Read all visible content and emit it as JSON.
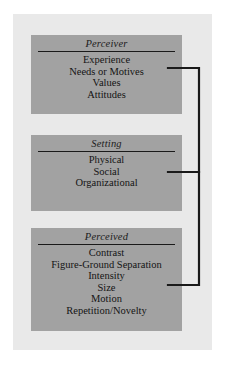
{
  "diagram": {
    "background_color": "#ffffff",
    "panel_color": "#e9e9e9",
    "box_color": "#a2a2a2",
    "line_color": "#1a1a1a",
    "text_color": "#141414",
    "boxes": [
      {
        "id": "perceiver",
        "title": "Perceiver",
        "items": [
          "Experience",
          "Needs or Motives",
          "Values",
          "Attitudes"
        ]
      },
      {
        "id": "setting",
        "title": "Setting",
        "items": [
          "Physical",
          "Social",
          "Organizational"
        ]
      },
      {
        "id": "perceived",
        "title": "Perceived",
        "items": [
          "Contrast",
          "Figure-Ground Separation",
          "Intensity",
          "Size",
          "Motion",
          "Repetition/Novelty"
        ]
      }
    ],
    "connector": {
      "type": "bracket",
      "description": "right-side bracket joining the three boxes",
      "spine_x": 199,
      "stub_y": [
        68,
        172,
        285
      ]
    }
  }
}
